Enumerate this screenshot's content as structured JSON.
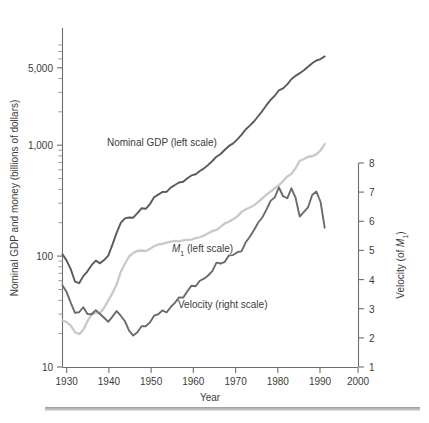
{
  "figure": {
    "background_color": "#ffffff",
    "axis_color": "#6e6e6e",
    "text_color": "#3b3b3b",
    "bottom_rule_color": "#9b9b9b"
  },
  "axis_titles": {
    "left": "Nominal GDP and money (billions of dollars)",
    "right_pre": "Velocity (of ",
    "right_sub": "M",
    "right_sub_index": "1",
    "right_post": ")",
    "bottom": "Year"
  },
  "ticks": {
    "x_labels": [
      "1930",
      "1940",
      "1950",
      "1960",
      "1970",
      "1980",
      "1990",
      "2000"
    ],
    "x_values": [
      1930,
      1940,
      1950,
      1960,
      1970,
      1980,
      1990,
      2000
    ],
    "y_left_labels": [
      "10",
      "100",
      "1,000",
      "5,000"
    ],
    "y_left_values": [
      10,
      100,
      1000,
      5000
    ],
    "y_right_labels": [
      "1",
      "2",
      "3",
      "4",
      "5",
      "6",
      "7",
      "8"
    ],
    "y_right_values": [
      1,
      2,
      3,
      4,
      5,
      6,
      7,
      8
    ]
  },
  "series_labels": {
    "gdp": "Nominal GDP (left scale)",
    "m1_pre": "M",
    "m1_sub": "1",
    "m1_post": " (left scale)",
    "velocity": "Velocity (right scale)"
  },
  "colors": {
    "gdp": "#5a5a5a",
    "m1": "#c9c9c9",
    "velocity": "#6b6b6b"
  },
  "chart_data": {
    "type": "line",
    "title": "",
    "subtitle": "",
    "xlabel": "Year",
    "ylabel": "Nominal GDP and money (billions of dollars)",
    "y2label": "Velocity (of M1)",
    "xlim": [
      1929,
      2000
    ],
    "ylim": [
      10,
      8000
    ],
    "yscale": "log",
    "y2lim": [
      1,
      8
    ],
    "y2scale": "linear",
    "grid": false,
    "legend": "inline-annotations",
    "series": [
      {
        "name": "Nominal GDP (left scale)",
        "axis": "left",
        "units": "billions of dollars",
        "color": "#5a5a5a",
        "x": [
          1929,
          1930,
          1931,
          1932,
          1933,
          1934,
          1935,
          1936,
          1937,
          1938,
          1939,
          1940,
          1941,
          1942,
          1943,
          1944,
          1945,
          1946,
          1947,
          1948,
          1949,
          1950,
          1951,
          1952,
          1953,
          1954,
          1955,
          1956,
          1957,
          1958,
          1959,
          1960,
          1961,
          1962,
          1963,
          1964,
          1965,
          1966,
          1967,
          1968,
          1969,
          1970,
          1971,
          1972,
          1973,
          1974,
          1975,
          1976,
          1977,
          1978,
          1979,
          1980,
          1981,
          1982,
          1983,
          1984,
          1985,
          1986,
          1987,
          1988,
          1989,
          1990,
          1991,
          1992
        ],
        "y": [
          104,
          91,
          76,
          59,
          57,
          66,
          73,
          83,
          91,
          86,
          92,
          101,
          127,
          162,
          199,
          219,
          223,
          222,
          244,
          270,
          267,
          294,
          339,
          358,
          379,
          380,
          414,
          438,
          461,
          468,
          504,
          534,
          547,
          586,
          618,
          664,
          720,
          788,
          833,
          910,
          985,
          1039,
          1128,
          1240,
          1386,
          1501,
          1635,
          1824,
          2031,
          2295,
          2563,
          2789,
          3128,
          3255,
          3537,
          3933,
          4220,
          4463,
          4740,
          5104,
          5484,
          5803,
          5986,
          6319
        ]
      },
      {
        "name": "M1 (left scale)",
        "axis": "left",
        "units": "billions of dollars",
        "color": "#c9c9c9",
        "x": [
          1929,
          1930,
          1931,
          1932,
          1933,
          1934,
          1935,
          1936,
          1937,
          1938,
          1939,
          1940,
          1941,
          1942,
          1943,
          1944,
          1945,
          1946,
          1947,
          1948,
          1949,
          1950,
          1951,
          1952,
          1953,
          1954,
          1955,
          1956,
          1957,
          1958,
          1959,
          1960,
          1961,
          1962,
          1963,
          1964,
          1965,
          1966,
          1967,
          1968,
          1969,
          1970,
          1971,
          1972,
          1973,
          1974,
          1975,
          1976,
          1977,
          1978,
          1979,
          1980,
          1981,
          1982,
          1983,
          1984,
          1985,
          1986,
          1987,
          1988,
          1989,
          1990,
          1991,
          1992
        ],
        "y": [
          26.4,
          25.4,
          23.6,
          20.6,
          19.8,
          21.7,
          25.9,
          29.6,
          30.9,
          30.5,
          34.2,
          39.7,
          46.5,
          55.4,
          72.2,
          85.3,
          99.2,
          106.5,
          111.5,
          112.3,
          111.2,
          116.2,
          122.7,
          127.4,
          128.8,
          132.3,
          135.2,
          136.9,
          135.9,
          138.4,
          140.0,
          140.7,
          145.2,
          147.9,
          153.4,
          160.4,
          167.9,
          172.1,
          183.2,
          197.5,
          204.0,
          214.5,
          228.4,
          249.3,
          262.9,
          274.4,
          287.6,
          306.4,
          331.4,
          358.4,
          382.5,
          408.9,
          436.7,
          474.5,
          521.2,
          551.6,
          620.1,
          724.5,
          750.2,
          787.0,
          794.8,
          826.4,
          897.0,
          1025.0
        ]
      },
      {
        "name": "Velocity (right scale)",
        "axis": "right",
        "units": "ratio of nominal GDP to M1",
        "color": "#6b6b6b",
        "x": [
          1929,
          1930,
          1931,
          1932,
          1933,
          1934,
          1935,
          1936,
          1937,
          1938,
          1939,
          1940,
          1941,
          1942,
          1943,
          1944,
          1945,
          1946,
          1947,
          1948,
          1949,
          1950,
          1951,
          1952,
          1953,
          1954,
          1955,
          1956,
          1957,
          1958,
          1959,
          1960,
          1961,
          1962,
          1963,
          1964,
          1965,
          1966,
          1967,
          1968,
          1969,
          1970,
          1971,
          1972,
          1973,
          1974,
          1975,
          1976,
          1977,
          1978,
          1979,
          1980,
          1981,
          1982,
          1983,
          1984,
          1985,
          1986,
          1987,
          1988,
          1989,
          1990,
          1991,
          1992
        ],
        "y": [
          3.8,
          3.57,
          3.2,
          2.86,
          2.88,
          3.05,
          2.82,
          2.81,
          2.95,
          2.82,
          2.69,
          2.55,
          2.73,
          2.92,
          2.76,
          2.57,
          2.25,
          2.08,
          2.19,
          2.4,
          2.4,
          2.53,
          2.76,
          2.81,
          2.94,
          2.87,
          3.06,
          3.2,
          3.39,
          3.38,
          3.6,
          3.79,
          3.77,
          3.96,
          4.03,
          4.14,
          4.29,
          4.58,
          4.55,
          4.61,
          4.83,
          4.84,
          4.94,
          4.97,
          5.27,
          5.47,
          5.69,
          5.95,
          6.13,
          6.4,
          6.7,
          6.82,
          7.16,
          6.86,
          6.79,
          7.13,
          6.81,
          6.16,
          6.32,
          6.48,
          6.9,
          7.02,
          6.67,
          5.78
        ]
      }
    ],
    "annotations": [
      {
        "text": "Nominal GDP (left scale)",
        "x": 1940,
        "y": 1100
      },
      {
        "text": "M1 (left scale)",
        "x": 1955,
        "y": 140
      },
      {
        "text": "Velocity (right scale)",
        "x": 1960,
        "y_right": 3.4
      }
    ]
  }
}
